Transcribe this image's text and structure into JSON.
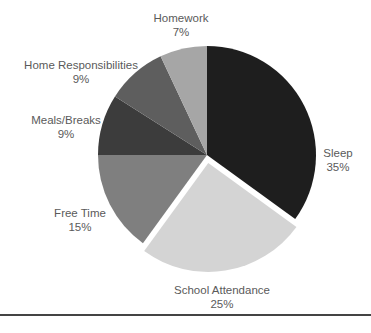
{
  "chart_data": {
    "type": "pie",
    "title": "",
    "start_angle_deg": 0,
    "direction": "clockwise",
    "center": [
      207,
      155
    ],
    "radius": 109,
    "slices": [
      {
        "label": "Sleep",
        "value": 35,
        "display": "35%",
        "color": "#1e1e1e",
        "explode": 0,
        "label_pos": [
          338,
          146
        ]
      },
      {
        "label": "School Attendance",
        "value": 25,
        "display": "25%",
        "color": "#d4d4d4",
        "explode": 8,
        "label_pos": [
          222,
          283
        ]
      },
      {
        "label": "Free Time",
        "value": 15,
        "display": "15%",
        "color": "#7f7f7f",
        "explode": 0,
        "label_pos": [
          80,
          206
        ]
      },
      {
        "label": "Meals/Breaks",
        "value": 9,
        "display": "9%",
        "color": "#3c3c3c",
        "explode": 0,
        "label_pos": [
          66,
          113
        ]
      },
      {
        "label": "Home Responsibilities",
        "value": 9,
        "display": "9%",
        "color": "#5e5e5e",
        "explode": 0,
        "label_pos": [
          81,
          58
        ]
      },
      {
        "label": "Homework",
        "value": 7,
        "display": "7%",
        "color": "#a6a6a6",
        "explode": 0,
        "label_pos": [
          181,
          11
        ]
      }
    ],
    "legend": "none",
    "labels_outside": true
  },
  "footer": {
    "rule_color": "#444444"
  }
}
